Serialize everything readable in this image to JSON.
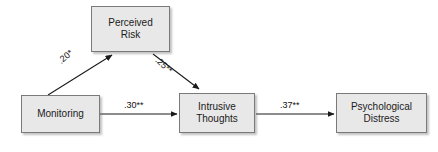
{
  "diagram": {
    "type": "path-model",
    "nodes": [
      {
        "id": "monitoring",
        "label": "Monitoring"
      },
      {
        "id": "perceived_risk",
        "label": "Perceived\nRisk"
      },
      {
        "id": "intrusive_thoughts",
        "label": "Intrusive\nThoughts"
      },
      {
        "id": "psychological_distress",
        "label": "Psychological\nDistress"
      }
    ],
    "edges": [
      {
        "from": "monitoring",
        "to": "perceived_risk",
        "label": ".20*"
      },
      {
        "from": "perceived_risk",
        "to": "intrusive_thoughts",
        "label": ".25**"
      },
      {
        "from": "monitoring",
        "to": "intrusive_thoughts",
        "label": ".30**"
      },
      {
        "from": "intrusive_thoughts",
        "to": "psychological_distress",
        "label": ".37**"
      }
    ],
    "colors": {
      "box_fill": "#e8e8e8",
      "box_border": "#7a7a7a",
      "arrow": "#1a1a1a",
      "text": "#1b1b1b",
      "background": "#ffffff"
    }
  }
}
